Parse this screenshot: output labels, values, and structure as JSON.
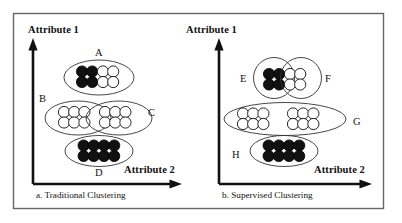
{
  "figure": {
    "border_color": "#555555",
    "stroke_color": "#1a1a1a",
    "dot_fill_dark": "#111111",
    "dot_fill_light": "#ffffff",
    "panels": [
      {
        "id": "traditional",
        "caption": "a. Traditional Clustering",
        "y_axis_label": "Attribute 1",
        "x_axis_label": "Attribute 2",
        "clusters": [
          {
            "label": "A",
            "shape": "ellipse",
            "contents": "4 dark dots and 4 light dots"
          },
          {
            "label": "B",
            "shape": "ellipse",
            "contents": "6 light dots"
          },
          {
            "label": "C",
            "shape": "ellipse",
            "contents": "6 light dots"
          },
          {
            "label": "D",
            "shape": "ellipse",
            "contents": "8 dark dots"
          }
        ]
      },
      {
        "id": "supervised",
        "caption": "b. Supervised Clustering",
        "y_axis_label": "Attribute 1",
        "x_axis_label": "Attribute 2",
        "clusters": [
          {
            "label": "E",
            "shape": "circle",
            "contents": "4 dark dots"
          },
          {
            "label": "F",
            "shape": "circle",
            "contents": "4 light dots"
          },
          {
            "label": "G",
            "shape": "ellipse",
            "contents": "12 light dots"
          },
          {
            "label": "H",
            "shape": "ellipse",
            "contents": "8 dark dots"
          }
        ]
      }
    ]
  },
  "labels": {
    "left_attr1": "Attribute 1",
    "left_attr2": "Attribute 2",
    "left_caption": "a. Traditional Clustering",
    "right_attr1": "Attribute 1",
    "right_attr2": "Attribute 2",
    "right_caption": "b. Supervised Clustering",
    "A": "A",
    "B": "B",
    "C": "C",
    "D": "D",
    "E": "E",
    "F": "F",
    "G": "G",
    "H": "H"
  }
}
